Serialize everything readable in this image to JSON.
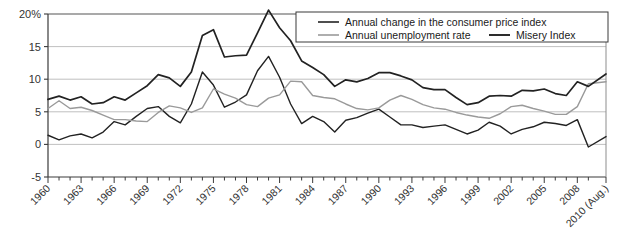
{
  "chart_data": {
    "type": "line",
    "title": "",
    "xlabel": "",
    "ylabel": "",
    "ylim": [
      -5,
      20
    ],
    "xlim": [
      1960,
      2010.6
    ],
    "grid": true,
    "legend_position": "top-right",
    "y_ticks": [
      "20%",
      "15",
      "10",
      "5",
      "0",
      "-5"
    ],
    "y_tick_values": [
      20,
      15,
      10,
      5,
      0,
      -5
    ],
    "x_tick_labels": [
      "1960",
      "1963",
      "1966",
      "1969",
      "1972",
      "1975",
      "1978",
      "1981",
      "1984",
      "1987",
      "1990",
      "1993",
      "1996",
      "1999",
      "2002",
      "2005",
      "2008",
      "2010 (Aug.)"
    ],
    "x_tick_values": [
      1960,
      1963,
      1966,
      1969,
      1972,
      1975,
      1978,
      1981,
      1984,
      1987,
      1990,
      1993,
      1996,
      1999,
      2002,
      2005,
      2008,
      2010.6
    ],
    "x": [
      1960,
      1961,
      1962,
      1963,
      1964,
      1965,
      1966,
      1967,
      1968,
      1969,
      1970,
      1971,
      1972,
      1973,
      1974,
      1975,
      1976,
      1977,
      1978,
      1979,
      1980,
      1981,
      1982,
      1983,
      1984,
      1985,
      1986,
      1987,
      1988,
      1989,
      1990,
      1991,
      1992,
      1993,
      1994,
      1995,
      1996,
      1997,
      1998,
      1999,
      2000,
      2001,
      2002,
      2003,
      2004,
      2005,
      2006,
      2007,
      2008,
      2009,
      2010.6
    ],
    "series": [
      {
        "name": "Annual change in the consumer price index",
        "color": "#222222",
        "width": 1.4,
        "values": [
          1.4,
          0.7,
          1.3,
          1.6,
          1.0,
          1.9,
          3.5,
          3.0,
          4.3,
          5.5,
          5.8,
          4.3,
          3.3,
          6.2,
          11.1,
          9.1,
          5.7,
          6.5,
          7.6,
          11.3,
          13.5,
          10.3,
          6.2,
          3.2,
          4.3,
          3.5,
          1.9,
          3.7,
          4.1,
          4.8,
          5.4,
          4.2,
          3.0,
          3.0,
          2.6,
          2.8,
          3.0,
          2.3,
          1.6,
          2.2,
          3.4,
          2.8,
          1.6,
          2.3,
          2.7,
          3.4,
          3.2,
          2.9,
          3.8,
          -0.4,
          1.2
        ]
      },
      {
        "name": "Annual unemployment rate",
        "color": "#9a9a9a",
        "width": 1.4,
        "values": [
          5.5,
          6.7,
          5.5,
          5.7,
          5.2,
          4.5,
          3.8,
          3.8,
          3.6,
          3.5,
          4.9,
          5.9,
          5.6,
          4.9,
          5.6,
          8.5,
          7.7,
          7.1,
          6.1,
          5.8,
          7.1,
          7.6,
          9.7,
          9.6,
          7.5,
          7.2,
          7.0,
          6.2,
          5.5,
          5.3,
          5.6,
          6.8,
          7.5,
          6.9,
          6.1,
          5.6,
          5.4,
          4.9,
          4.5,
          4.2,
          4.0,
          4.7,
          5.8,
          6.0,
          5.5,
          5.1,
          4.6,
          4.6,
          5.8,
          9.3,
          9.6
        ]
      },
      {
        "name": "Misery Index",
        "color": "#222222",
        "width": 1.7,
        "values": [
          6.9,
          7.4,
          6.8,
          7.3,
          6.2,
          6.4,
          7.3,
          6.8,
          7.9,
          9.0,
          10.7,
          10.2,
          8.9,
          11.1,
          16.7,
          17.6,
          13.4,
          13.6,
          13.7,
          17.1,
          20.6,
          17.9,
          15.9,
          12.8,
          11.8,
          10.7,
          8.9,
          9.9,
          9.6,
          10.1,
          11.0,
          11.0,
          10.5,
          9.9,
          8.7,
          8.4,
          8.4,
          7.2,
          6.1,
          6.4,
          7.4,
          7.5,
          7.4,
          8.3,
          8.2,
          8.5,
          7.8,
          7.5,
          9.6,
          8.9,
          10.8
        ]
      }
    ]
  },
  "legend": {
    "items": [
      {
        "label": "Annual change in the consumer price index",
        "color": "#222222"
      },
      {
        "label": "Annual unemployment rate",
        "color": "#9a9a9a"
      },
      {
        "label": "Misery Index",
        "color": "#222222"
      }
    ]
  }
}
